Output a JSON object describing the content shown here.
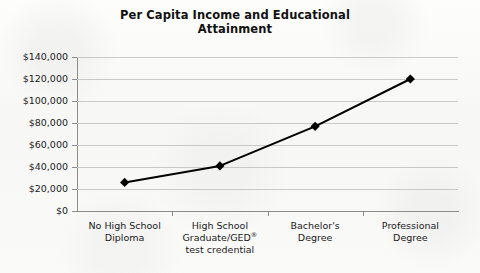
{
  "chart_data": {
    "type": "line",
    "title": "Per Capita Income and Educational Attainment",
    "title_line1": "Per Capita Income and Educational",
    "title_line2": "Attainment",
    "xlabel": "",
    "ylabel": "",
    "grid": true,
    "legend": false,
    "marker": "diamond",
    "series_color": "#000000",
    "grid_color": "#c9c9c9",
    "axis_color": "#8c8c8c",
    "ylim": [
      0,
      140000
    ],
    "ytick_values": [
      140000,
      120000,
      100000,
      80000,
      60000,
      40000,
      20000,
      0
    ],
    "ytick_labels": [
      "$140,000",
      "$120,000",
      "$100,000",
      "$80,000",
      "$60,000",
      "$40,000",
      "$20,000",
      "$0"
    ],
    "categories": [
      "No High School Diploma",
      "High School Graduate/GED® test credential",
      "Bachelor's Degree",
      "Professional Degree"
    ],
    "category_lines": [
      [
        "No High School",
        "Diploma"
      ],
      [
        "High School",
        "Graduate/GED®",
        "test credential"
      ],
      [
        "Bachelor's",
        "Degree"
      ],
      [
        "Professional",
        "Degree"
      ]
    ],
    "values": [
      26000,
      41000,
      77000,
      120000
    ]
  }
}
